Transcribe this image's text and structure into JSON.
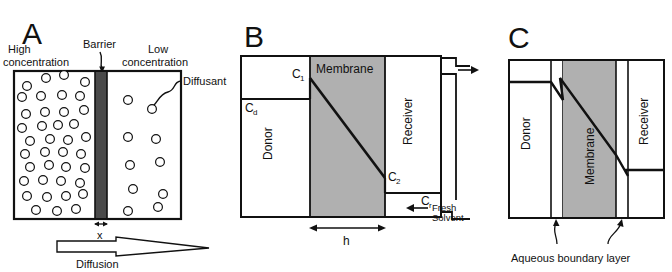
{
  "figure": {
    "colors": {
      "line": "#111111",
      "membrane_fill": "#b0b0b0",
      "barrier_fill": "#4a4a4a",
      "background": "#ffffff"
    }
  },
  "panel_a": {
    "letter": "A",
    "label_high": "High",
    "label_high2": "concentration",
    "label_barrier": "Barrier",
    "label_low": "Low",
    "label_low2": "concentration",
    "label_diffusant": "Diffusant",
    "label_thickness": "x",
    "label_diffusion": "Diffusion",
    "left_circles": [
      [
        27,
        86
      ],
      [
        46,
        78
      ],
      [
        64,
        75
      ],
      [
        85,
        82
      ],
      [
        22,
        97
      ],
      [
        41,
        96
      ],
      [
        62,
        95
      ],
      [
        80,
        96
      ],
      [
        26,
        114
      ],
      [
        45,
        112
      ],
      [
        64,
        112
      ],
      [
        84,
        110
      ],
      [
        22,
        128
      ],
      [
        42,
        126
      ],
      [
        58,
        125
      ],
      [
        74,
        124
      ],
      [
        30,
        141
      ],
      [
        50,
        139
      ],
      [
        68,
        140
      ],
      [
        86,
        137
      ],
      [
        25,
        154
      ],
      [
        45,
        152
      ],
      [
        63,
        152
      ],
      [
        81,
        154
      ],
      [
        30,
        167
      ],
      [
        49,
        165
      ],
      [
        66,
        167
      ],
      [
        85,
        168
      ],
      [
        24,
        181
      ],
      [
        43,
        180
      ],
      [
        61,
        181
      ],
      [
        80,
        183
      ],
      [
        27,
        196
      ],
      [
        47,
        197
      ],
      [
        66,
        196
      ],
      [
        83,
        194
      ],
      [
        36,
        210
      ],
      [
        57,
        211
      ],
      [
        76,
        209
      ]
    ],
    "right_circles": [
      [
        128,
        100
      ],
      [
        152,
        109
      ],
      [
        128,
        137
      ],
      [
        156,
        139
      ],
      [
        130,
        165
      ],
      [
        160,
        162
      ],
      [
        133,
        189
      ],
      [
        163,
        194
      ],
      [
        128,
        211
      ],
      [
        158,
        207
      ]
    ]
  },
  "panel_b": {
    "letter": "B",
    "label_membrane": "Membrane",
    "label_donor": "Donor",
    "label_receiver": "Receiver",
    "label_c1": "C",
    "label_c1_sub": "1",
    "label_c2": "C",
    "label_c2_sub": "2",
    "label_cd": "C",
    "label_cd_sub": "d",
    "label_cr": "C",
    "label_cr_sub": "r",
    "label_h": "h",
    "label_fresh": "Fresh",
    "label_solvent": "Solvent"
  },
  "panel_c": {
    "letter": "C",
    "label_donor": "Donor",
    "label_membrane": "Membrane",
    "label_receiver": "Receiver",
    "label_boundary": "Aqueous boundary layer"
  }
}
